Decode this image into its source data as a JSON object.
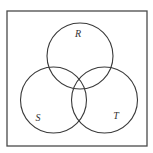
{
  "diagram": {
    "type": "venn",
    "universe": {
      "x": 7,
      "y": 11,
      "width": 140,
      "height": 135
    },
    "sets": [
      {
        "id": "R",
        "label": "R",
        "cx": 80,
        "cy": 56,
        "r": 33,
        "label_x": 78,
        "label_y": 33
      },
      {
        "id": "S",
        "label": "S",
        "cx": 53.5,
        "cy": 100,
        "r": 33,
        "label_x": 38,
        "label_y": 117
      },
      {
        "id": "T",
        "label": "T",
        "cx": 104.5,
        "cy": 100,
        "r": 33,
        "label_x": 116,
        "label_y": 115
      }
    ],
    "colors": {
      "stroke": "#3a3a3a",
      "frame": "#4a4a4a",
      "background": "#ffffff",
      "label": "#333333"
    }
  }
}
